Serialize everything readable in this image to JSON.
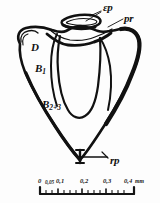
{
  "figure": {
    "kind": "scientific-line-drawing",
    "ink_color": "#111111",
    "background_color": "#fdfdfd"
  },
  "labels": [
    {
      "id": "ep",
      "text": "εp",
      "role": "cusp-label-epsilon-p"
    },
    {
      "id": "pr",
      "text": "pr",
      "role": "cusp-label-pr"
    },
    {
      "id": "d",
      "text": "D",
      "role": "cusp-label-d"
    },
    {
      "id": "b1",
      "base": "B",
      "sub": "1",
      "role": "cusp-label-b1"
    },
    {
      "id": "b23",
      "base": "B",
      "sub": "2+3",
      "role": "cusp-label-b2-3"
    },
    {
      "id": "rp",
      "text": "rp",
      "role": "structure-label-rp"
    }
  ],
  "scale_bar": {
    "unit": "mm",
    "ticks": [
      {
        "value": "0",
        "major": true
      },
      {
        "value": "0,05",
        "major": false
      },
      {
        "value": "0,1",
        "major": true
      },
      {
        "value": "0,2",
        "major": true
      },
      {
        "value": "0,3",
        "major": true
      },
      {
        "value": "0,4",
        "major": true
      }
    ]
  }
}
